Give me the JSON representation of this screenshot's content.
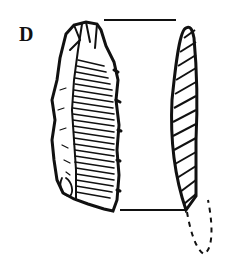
{
  "figure": {
    "label": "D",
    "colors": {
      "ink": "#111111",
      "background": "#ffffff"
    }
  }
}
